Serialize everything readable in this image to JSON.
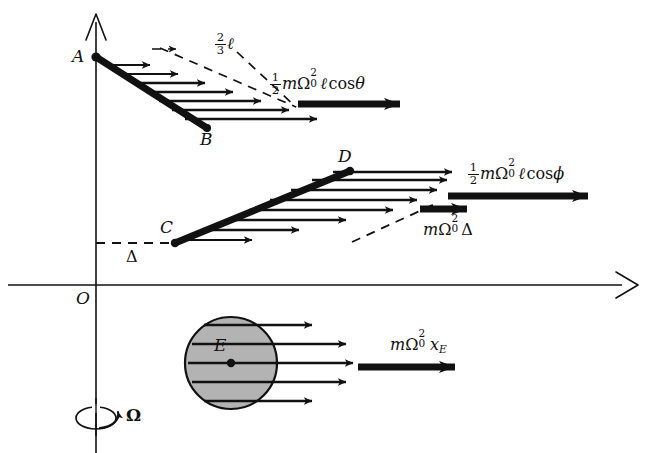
{
  "figure": {
    "background_color": "#ffffff",
    "ink_color": "#111111",
    "sphere_fill": "#b3b3b3",
    "width": 661,
    "height": 453
  },
  "axes": {
    "vertical_axis_label": "",
    "horizontal_axis_label": "",
    "origin_label": "O",
    "rotation_label": "Ω"
  },
  "points": {
    "a": "A",
    "b": "B",
    "c": "C",
    "d": "D",
    "e": "E"
  },
  "dimensions": {
    "two_thirds_ell": {
      "num": "2",
      "den": "3",
      "symbol": "ℓ"
    },
    "delta": "Δ"
  },
  "force_labels": {
    "rod_ab": {
      "fraction": {
        "num": "1",
        "den": "2"
      },
      "mass": "m",
      "omega": "Ω",
      "omega_sup": "2",
      "omega_sub": "0",
      "length": "ℓ",
      "trig": "cos",
      "angle": "θ",
      "plain": "½ mΩ₀² ℓ cos θ"
    },
    "rod_cd": {
      "fraction": {
        "num": "1",
        "den": "2"
      },
      "mass": "m",
      "omega": "Ω",
      "omega_sup": "2",
      "omega_sub": "0",
      "length": "ℓ",
      "trig": "cos",
      "angle": "ϕ",
      "plain": "½ mΩ₀² ℓ cos ϕ"
    },
    "offset_delta": {
      "mass": "m",
      "omega": "Ω",
      "omega_sup": "2",
      "omega_sub": "0",
      "variable": "Δ",
      "plain": "mΩ₀² Δ"
    },
    "sphere": {
      "mass": "m",
      "omega": "Ω",
      "omega_sup": "2",
      "omega_sub": "0",
      "variable": "x",
      "variable_sub": "E",
      "plain": "mΩ₀² xₑ"
    }
  }
}
